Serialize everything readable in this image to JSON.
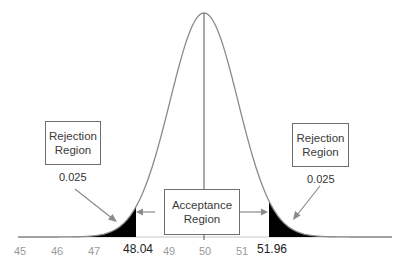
{
  "chart_data": {
    "type": "area",
    "title": "",
    "distribution": "normal",
    "mean": 50,
    "xlabel": "",
    "ylabel": "",
    "xlim": [
      45,
      53
    ],
    "tick_labels": [
      "45",
      "46",
      "47",
      "49",
      "50",
      "51"
    ],
    "critical_values": [
      "48.04",
      "51.96"
    ],
    "regions": [
      {
        "name": "Rejection Region",
        "side": "left",
        "area": "0.025"
      },
      {
        "name": "Acceptance Region",
        "side": "center"
      },
      {
        "name": "Rejection Region",
        "side": "right",
        "area": "0.025"
      }
    ],
    "grid": false,
    "legend": "none"
  },
  "labels": {
    "left_box": [
      "Rejection",
      "Region"
    ],
    "left_area": "0.025",
    "center_box": [
      "Acceptance",
      "Region"
    ],
    "right_box": [
      "Rejection",
      "Region"
    ],
    "right_area": "0.025",
    "crit_left": "48.04",
    "crit_right": "51.96",
    "ticks": [
      "45",
      "46",
      "47",
      "49",
      "50",
      "51"
    ]
  },
  "colors": {
    "curve": "#8a8a8a",
    "tail_fill": "#000000",
    "axis": "#b0b0b0",
    "arrow": "#8a8a8a"
  }
}
